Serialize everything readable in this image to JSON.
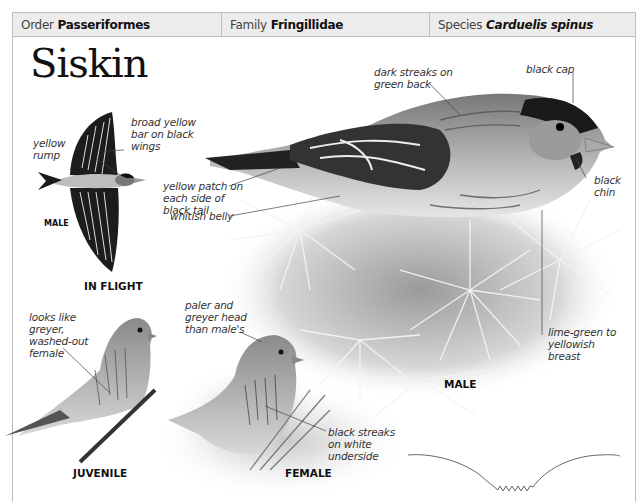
{
  "header": {
    "order_label": "Order",
    "order_value": "Passeriformes",
    "family_label": "Family",
    "family_value": "Fringillidae",
    "species_label": "Species",
    "species_value": "Carduelis spinus"
  },
  "title": "Siskin",
  "flight": {
    "caption": "IN FLIGHT",
    "sex_label": "MALE",
    "annotations": [
      "broad yellow bar on black wings",
      "yellow rump"
    ]
  },
  "male": {
    "caption": "MALE",
    "annotations": {
      "back": "dark streaks on green back",
      "cap": "black cap",
      "chin": "black chin",
      "tail": "yellow patch on each side of black tail",
      "belly": "whitish belly",
      "breast": "lime-green to yellowish breast"
    }
  },
  "juvenile": {
    "caption": "JUVENILE",
    "annotation": "looks like greyer, washed-out female"
  },
  "female": {
    "caption": "FEMALE",
    "annotations": {
      "head": "paler and greyer head than male's",
      "underside": "black streaks on white underside"
    }
  },
  "flight_pattern": {
    "icon": "flight-path-icon"
  }
}
